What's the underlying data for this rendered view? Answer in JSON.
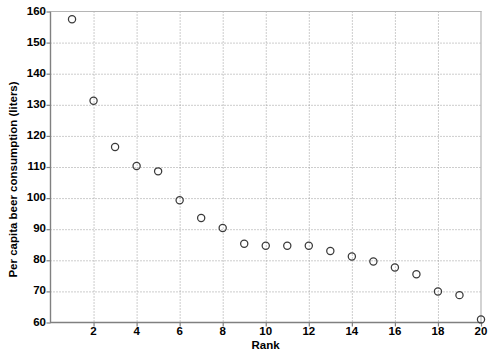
{
  "chart_data": {
    "type": "scatter",
    "title": "",
    "xlabel": "Rank",
    "ylabel": "Per capita beer consumption (liters)",
    "xlim": [
      0,
      20
    ],
    "ylim": [
      60,
      160
    ],
    "xticks": [
      2,
      4,
      6,
      8,
      10,
      12,
      14,
      16,
      18,
      20
    ],
    "yticks": [
      60,
      70,
      80,
      90,
      100,
      110,
      120,
      130,
      140,
      150,
      160
    ],
    "grid": true,
    "legend": null,
    "marker": "open-circle",
    "marker_color": "#3a3a3a",
    "x": [
      1,
      2,
      3,
      4,
      5,
      6,
      7,
      8,
      9,
      10,
      11,
      12,
      13,
      14,
      15,
      16,
      17,
      18,
      19,
      20
    ],
    "values": [
      157.5,
      131.3,
      116.4,
      110.3,
      108.6,
      99.3,
      93.6,
      90.4,
      85.3,
      84.7,
      84.7,
      84.7,
      83.0,
      81.2,
      79.6,
      77.7,
      75.5,
      70.0,
      68.8,
      61.0
    ],
    "series": [
      {
        "name": "Per capita beer consumption",
        "values": [
          157.5,
          131.3,
          116.4,
          110.3,
          108.6,
          99.3,
          93.6,
          90.4,
          85.3,
          84.7,
          84.7,
          84.7,
          83.0,
          81.2,
          79.6,
          77.7,
          75.5,
          70.0,
          68.8,
          61.0
        ]
      }
    ]
  },
  "axes": {
    "y_title": "Per capita beer consumption (liters)",
    "x_title": "Rank",
    "y_tick_labels": [
      "160",
      "150",
      "140",
      "130",
      "120",
      "110",
      "100",
      "90",
      "80",
      "70",
      "60"
    ],
    "x_tick_labels": [
      "2",
      "4",
      "6",
      "8",
      "10",
      "12",
      "14",
      "16",
      "18",
      "20"
    ]
  },
  "style": {
    "axis_color": "#808080",
    "grid_color": "#9a9a9a",
    "text_color": "#000000",
    "marker_stroke": "#3a3a3a",
    "background": "#ffffff"
  }
}
